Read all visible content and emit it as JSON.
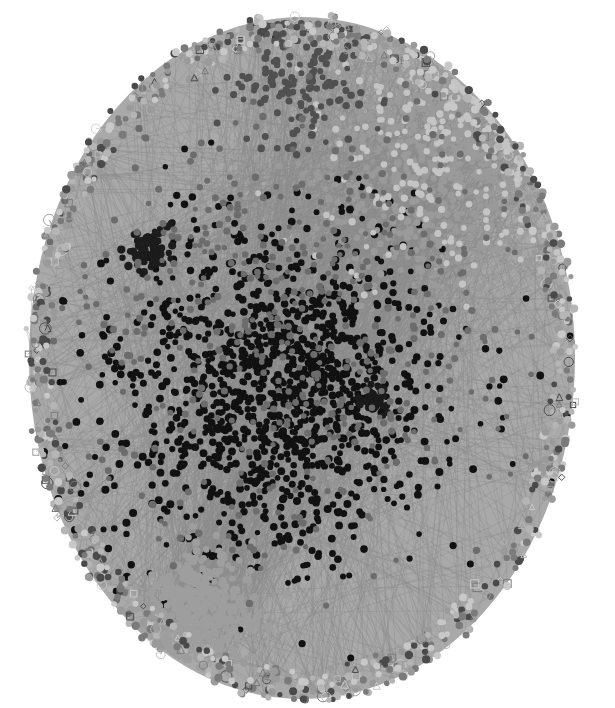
{
  "figure": {
    "type": "force-directed network",
    "palette": "grayscale",
    "background": "#ffffff",
    "layout": {
      "center_x": 302,
      "center_y": 358,
      "radius_x": 277,
      "radius_y": 345
    },
    "edge_color": "#8c8c8c",
    "node_shapes": [
      "circle",
      "square",
      "triangle",
      "diamond",
      "hollow-circle"
    ],
    "clusters": [
      {
        "name": "core-black",
        "color": "#111111",
        "cx": 280,
        "cy": 390,
        "spread": 165,
        "count": 1300,
        "shape": "circle",
        "r": 3.2
      },
      {
        "name": "upper-right-light",
        "color": "#9a9a9a",
        "cx": 430,
        "cy": 160,
        "spread": 110,
        "count": 700,
        "shape": "circle",
        "r": 3.0
      },
      {
        "name": "upper-right-pale",
        "color": "#c4c4c4",
        "cx": 440,
        "cy": 150,
        "spread": 120,
        "count": 260,
        "shape": "circle",
        "r": 3.0
      },
      {
        "name": "upper-mid-dark",
        "color": "#505050",
        "cx": 300,
        "cy": 80,
        "spread": 70,
        "count": 160,
        "shape": "circle",
        "r": 3.2
      },
      {
        "name": "bottom-left-gray",
        "color": "#9e9e9e",
        "cx": 195,
        "cy": 610,
        "spread": 55,
        "count": 380,
        "shape": "circle",
        "r": 3.4
      },
      {
        "name": "left-dark-cluster",
        "color": "#1c1c1c",
        "cx": 150,
        "cy": 250,
        "spread": 22,
        "count": 80,
        "shape": "circle",
        "r": 3.4
      },
      {
        "name": "right-dark-cluster",
        "color": "#1a1a1a",
        "cx": 372,
        "cy": 400,
        "spread": 15,
        "count": 40,
        "shape": "circle",
        "r": 3.2
      },
      {
        "name": "mid-gray",
        "color": "#6c6c6c",
        "cx": 290,
        "cy": 330,
        "spread": 230,
        "count": 500,
        "shape": "circle",
        "r": 3.0
      }
    ],
    "rim": {
      "count": 900,
      "colors": [
        "#7a7a7a",
        "#9a9a9a",
        "#b5b5b5",
        "#4a4a4a",
        "#c8c8c8"
      ]
    },
    "edges": {
      "count": 2600,
      "opacity": 0.55,
      "width": 0.7
    },
    "seed": 7
  }
}
